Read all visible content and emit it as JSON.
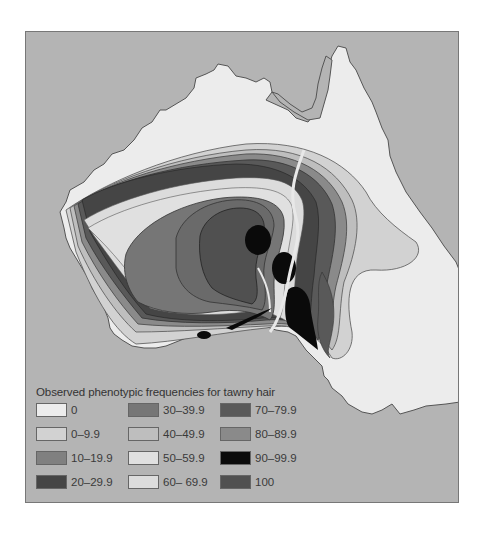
{
  "map": {
    "subject": "Australia",
    "sea_color": "#b4b4b4",
    "land_color": "#ececec"
  },
  "legend": {
    "title": "Observed phenotypic frequencies for tawny hair",
    "items": [
      {
        "label": "0",
        "color": "#ececec"
      },
      {
        "label": "0–9.9",
        "color": "#d2d2d2"
      },
      {
        "label": "10–19.9",
        "color": "#808080"
      },
      {
        "label": "20–29.9",
        "color": "#454545"
      },
      {
        "label": "30–39.9",
        "color": "#767676"
      },
      {
        "label": "40–49.9",
        "color": "#bebebe"
      },
      {
        "label": "50–59.9",
        "color": "#e0e0e0"
      },
      {
        "label": "60– 69.9",
        "color": "#dcdcdc"
      },
      {
        "label": "70–79.9",
        "color": "#595959"
      },
      {
        "label": "80–89.9",
        "color": "#8a8a8a"
      },
      {
        "label": "90–99.9",
        "color": "#0a0a0a"
      },
      {
        "label": "100",
        "color": "#505050"
      }
    ]
  }
}
